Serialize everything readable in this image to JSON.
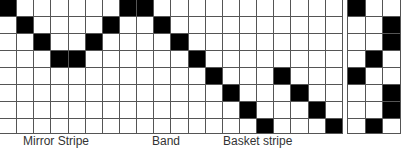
{
  "colors": {
    "filled": "#000000",
    "empty": "#ffffff",
    "grid_line": "#555555",
    "label_text": "#333333"
  },
  "main_grid": {
    "columns": 20,
    "rows": 8,
    "filled_cells": [
      [
        0,
        0
      ],
      [
        0,
        7
      ],
      [
        0,
        8
      ],
      [
        1,
        1
      ],
      [
        1,
        6
      ],
      [
        1,
        9
      ],
      [
        2,
        2
      ],
      [
        2,
        5
      ],
      [
        2,
        10
      ],
      [
        3,
        3
      ],
      [
        3,
        4
      ],
      [
        3,
        11
      ],
      [
        4,
        12
      ],
      [
        4,
        16
      ],
      [
        5,
        13
      ],
      [
        5,
        17
      ],
      [
        6,
        14
      ],
      [
        6,
        18
      ],
      [
        7,
        15
      ],
      [
        7,
        19
      ]
    ]
  },
  "side_grid": {
    "columns": 3,
    "rows": 8,
    "filled_cells": [
      [
        0,
        0
      ],
      [
        1,
        2
      ],
      [
        2,
        2
      ],
      [
        3,
        1
      ],
      [
        4,
        0
      ],
      [
        5,
        2
      ],
      [
        6,
        2
      ],
      [
        7,
        1
      ]
    ]
  },
  "labels": [
    {
      "text": "Mirror Stripe",
      "x": 23
    },
    {
      "text": "Band",
      "x": 152
    },
    {
      "text": "Basket stripe",
      "x": 223
    }
  ]
}
